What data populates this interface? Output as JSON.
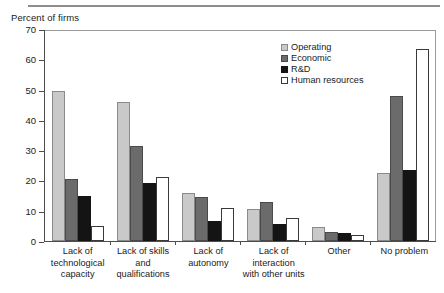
{
  "figure": {
    "axis_title": "Percent of firms"
  },
  "legend": {
    "position": "top-right",
    "items": [
      {
        "label": "Operating",
        "swatch": "operating",
        "color": "#c9c9c9"
      },
      {
        "label": "Economic",
        "swatch": "economic",
        "color": "#6b6b6b"
      },
      {
        "label": "R&D",
        "swatch": "rd",
        "color": "#141414"
      },
      {
        "label": "Human resources",
        "swatch": "human",
        "color": "#ffffff"
      }
    ]
  },
  "chart_data": {
    "type": "bar",
    "title": "",
    "subtitle": "",
    "xlabel": "",
    "ylabel": "Percent of firms",
    "ylim": [
      0,
      70
    ],
    "yticks": [
      0,
      10,
      20,
      30,
      40,
      50,
      60,
      70
    ],
    "ytick_labels": [
      "0",
      "10",
      "20",
      "30",
      "40",
      "50",
      "60",
      "70"
    ],
    "grid": false,
    "legend_position": "top-right",
    "categories": [
      "Lack of technological capacity",
      "Lack of skills and qualifications",
      "Lack of autonomy",
      "Lack of interaction with other units",
      "Other",
      "No problem"
    ],
    "category_lines": [
      [
        "Lack of",
        "technological",
        "capacity"
      ],
      [
        "Lack of skills",
        "and",
        "qualifications"
      ],
      [
        "Lack of",
        "autonomy"
      ],
      [
        "Lack of",
        "interaction",
        "with other units"
      ],
      [
        "Other"
      ],
      [
        "No problem"
      ]
    ],
    "series": [
      {
        "name": "Operating",
        "color": "#c9c9c9",
        "values": [
          49.5,
          46.0,
          16.0,
          10.5,
          4.5,
          22.5
        ]
      },
      {
        "name": "Economic",
        "color": "#6b6b6b",
        "values": [
          20.5,
          31.5,
          14.5,
          13.0,
          3.0,
          48.0
        ]
      },
      {
        "name": "R&D",
        "color": "#141414",
        "values": [
          15.0,
          19.0,
          6.5,
          5.5,
          2.5,
          23.5
        ]
      },
      {
        "name": "Human resources",
        "color": "#ffffff",
        "values": [
          5.0,
          21.0,
          11.0,
          7.5,
          2.0,
          63.5
        ]
      }
    ]
  }
}
